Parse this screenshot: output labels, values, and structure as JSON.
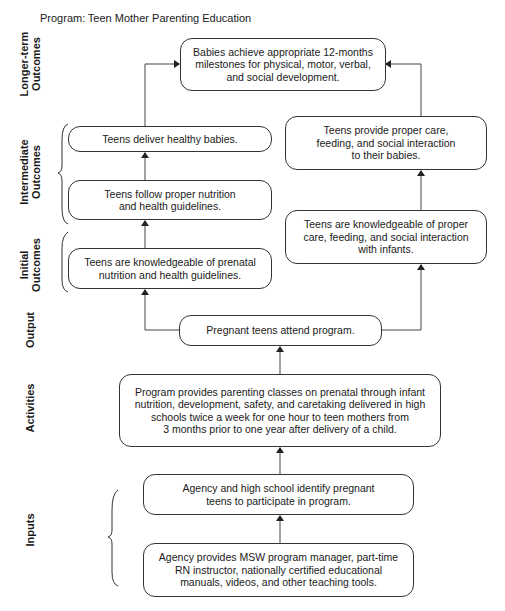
{
  "header": {
    "label": "Program:",
    "value": "Teen Mother Parenting Education"
  },
  "stages": {
    "longer_term": "Longer-term\nOutcomes",
    "intermediate": "Intermediate\nOutcomes",
    "initial": "Initial\nOutcomes",
    "output": "Output",
    "activities": "Activities",
    "inputs": "Inputs"
  },
  "boxes": {
    "longer_term": "Babies achieve appropriate 12-months\nmilestones for physical, motor, verbal,\nand social development.",
    "intermediate_left_top": "Teens deliver healthy babies.",
    "intermediate_left_bottom": "Teens follow proper nutrition\nand health guidelines.",
    "intermediate_right": "Teens provide proper care,\nfeeding, and social interaction\nto their babies.",
    "initial_left": "Teens are knowledgeable of prenatal\nnutrition and health guidelines.",
    "initial_right": "Teens are knowledgeable of proper\ncare, feeding, and social interaction\nwith infants.",
    "output": "Pregnant teens attend program.",
    "activities": "Program provides parenting classes on prenatal through infant\nnutrition, development, safety, and caretaking delivered in high\nschools twice a week for one hour to teen mothers from\n3 months prior to one year after delivery of a child.",
    "inputs_top": "Agency and high school identify pregnant\nteens to participate in program.",
    "inputs_bottom": "Agency provides MSW program manager, part-time\nRN instructor, nationally certified educational\nmanuals, videos, and other teaching tools."
  }
}
